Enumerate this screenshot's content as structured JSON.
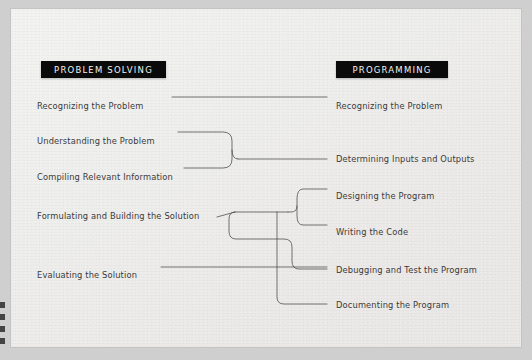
{
  "slide": {
    "background_color": "#efefed",
    "page_border_color": "#cfcfcf"
  },
  "headers": {
    "left": {
      "label": "PROBLEM SOLVING",
      "bg_color": "#0a0a0a",
      "text_color": "#f2f2f2"
    },
    "right": {
      "label": "PROGRAMMING",
      "bg_color": "#0a0a0a",
      "text_color": "#f2f2f2"
    }
  },
  "left_column": {
    "items": [
      {
        "label": "Recognizing the Problem"
      },
      {
        "label": "Understanding the Problem"
      },
      {
        "label": "Compiling Relevant Information"
      },
      {
        "label": "Formulating and Building the Solution"
      },
      {
        "label": "Evaluating the Solution"
      }
    ]
  },
  "right_column": {
    "items": [
      {
        "label": "Recognizing the Problem"
      },
      {
        "label": "Determining Inputs and Outputs"
      },
      {
        "label": "Designing the Program"
      },
      {
        "label": "Writing the Code"
      },
      {
        "label": "Debugging and Test the Program"
      },
      {
        "label": "Documenting the Program"
      }
    ]
  },
  "connectors": {
    "line_color": "#4a4a4a",
    "mappings": [
      {
        "from": [
          "Recognizing the Problem"
        ],
        "to": [
          "Recognizing the Problem"
        ]
      },
      {
        "from": [
          "Understanding the Problem",
          "Compiling Relevant Information"
        ],
        "to": [
          "Determining Inputs and Outputs"
        ]
      },
      {
        "from": [
          "Formulating and Building the Solution"
        ],
        "to": [
          "Designing the Program",
          "Writing the Code",
          "Debugging and Test the Program",
          "Documenting the Program"
        ]
      },
      {
        "from": [
          "Evaluating the Solution"
        ],
        "to": [
          "Debugging and Test the Program"
        ]
      }
    ]
  }
}
